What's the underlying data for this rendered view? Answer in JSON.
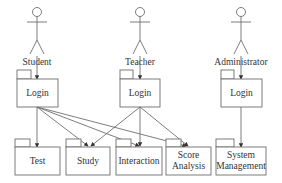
{
  "diagram": {
    "type": "UML use-case / package diagram",
    "colors": {
      "line": "#6e6e6e",
      "text": "#333333",
      "background": "#ffffff"
    },
    "actors": [
      {
        "id": "student",
        "label": "Student",
        "icon": "stick-figure-icon"
      },
      {
        "id": "teacher",
        "label": "Teacher",
        "icon": "stick-figure-icon"
      },
      {
        "id": "administrator",
        "label": "Administrator",
        "icon": "stick-figure-icon"
      }
    ],
    "login_packages": [
      {
        "owner": "student",
        "label": "Login"
      },
      {
        "owner": "teacher",
        "label": "Login"
      },
      {
        "owner": "administrator",
        "label": "Login"
      }
    ],
    "modules": [
      {
        "id": "test",
        "line1": "Test",
        "line2": ""
      },
      {
        "id": "study",
        "line1": "Study",
        "line2": ""
      },
      {
        "id": "interaction",
        "line1": "Interaction",
        "line2": ""
      },
      {
        "id": "score-analysis",
        "line1": "Score",
        "line2": "Analysis"
      },
      {
        "id": "system-management",
        "line1": "System",
        "line2": "Management"
      }
    ],
    "connections": [
      {
        "from": "student",
        "to": "student-login"
      },
      {
        "from": "teacher",
        "to": "teacher-login"
      },
      {
        "from": "administrator",
        "to": "administrator-login"
      },
      {
        "from": "student-login",
        "to": "test"
      },
      {
        "from": "student-login",
        "to": "study"
      },
      {
        "from": "student-login",
        "to": "interaction"
      },
      {
        "from": "student-login",
        "to": "score-analysis"
      },
      {
        "from": "teacher-login",
        "to": "study"
      },
      {
        "from": "teacher-login",
        "to": "interaction"
      },
      {
        "from": "teacher-login",
        "to": "score-analysis"
      },
      {
        "from": "administrator-login",
        "to": "system-management"
      }
    ]
  }
}
